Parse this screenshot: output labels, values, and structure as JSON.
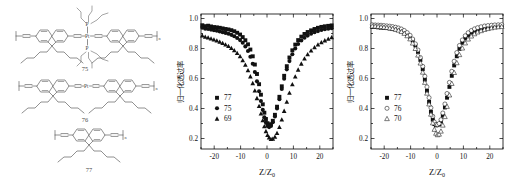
{
  "figure": {
    "background": "#ffffff",
    "panels": [
      "structures",
      "chart-left",
      "chart-right"
    ]
  },
  "structures": {
    "caption_75": "75",
    "caption_76": "76",
    "caption_77": "77",
    "atom_pt": "Pt",
    "atom_p_top": "P",
    "atom_p_bottom": "P",
    "repeat_n": "n",
    "items": [
      {
        "id": "75",
        "label": "75"
      },
      {
        "id": "76",
        "label": "76"
      },
      {
        "id": "77",
        "label": "77"
      }
    ]
  },
  "chart_data": [
    {
      "type": "scatter",
      "id": "chart-left",
      "title": "",
      "xlabel": "Z/Z0",
      "xlabel_main": "Z/Z",
      "xlabel_sub": "0",
      "ylabel": "归一化透过率",
      "xlim": [
        -25,
        25
      ],
      "ylim": [
        0.13,
        1.03
      ],
      "xticks": [
        -20,
        -10,
        0,
        10,
        20
      ],
      "xticklabels": [
        "-20",
        "-10",
        "0",
        "10",
        "20"
      ],
      "yticks": [
        0.2,
        0.4,
        0.6,
        0.8,
        1.0
      ],
      "yticklabels": [
        "0.2",
        "0.4",
        "0.6",
        "0.8",
        "1.0"
      ],
      "grid": false,
      "legend_position": "lower-left",
      "series": [
        {
          "name": "77",
          "marker": "filled-square",
          "x": [
            -24.5,
            -23.4,
            -22.3,
            -21.2,
            -20.1,
            -19.0,
            -17.9,
            -16.8,
            -15.7,
            -14.6,
            -13.5,
            -12.4,
            -11.3,
            -10.2,
            -9.2,
            -8.2,
            -7.2,
            -6.3,
            -5.4,
            -4.6,
            -3.8,
            -3.0,
            -2.3,
            -1.6,
            -1.0,
            -0.4,
            0.2,
            0.8,
            1.5,
            2.2,
            3.0,
            3.8,
            4.7,
            5.6,
            6.5,
            7.5,
            8.5,
            9.6,
            10.7,
            11.8,
            13.0,
            14.2,
            15.4,
            16.7,
            18.0,
            19.3,
            20.6,
            21.9,
            23.2,
            24.5
          ],
          "y": [
            0.955,
            0.949,
            0.952,
            0.947,
            0.943,
            0.941,
            0.938,
            0.934,
            0.93,
            0.927,
            0.922,
            0.915,
            0.905,
            0.893,
            0.876,
            0.855,
            0.828,
            0.793,
            0.748,
            0.693,
            0.63,
            0.562,
            0.492,
            0.428,
            0.372,
            0.33,
            0.302,
            0.29,
            0.295,
            0.318,
            0.358,
            0.412,
            0.478,
            0.548,
            0.618,
            0.682,
            0.74,
            0.788,
            0.826,
            0.856,
            0.879,
            0.897,
            0.91,
            0.921,
            0.93,
            0.938,
            0.944,
            0.948,
            0.951,
            0.954
          ]
        },
        {
          "name": "75",
          "marker": "filled-circle",
          "x": [
            -24.5,
            -23.4,
            -22.3,
            -21.2,
            -20.1,
            -19.0,
            -17.9,
            -16.8,
            -15.7,
            -14.6,
            -13.5,
            -12.4,
            -11.3,
            -10.2,
            -9.2,
            -8.2,
            -7.2,
            -6.3,
            -5.4,
            -4.6,
            -3.8,
            -3.0,
            -2.3,
            -1.6,
            -1.0,
            -0.4,
            0.2,
            0.8,
            1.5,
            2.2,
            3.0,
            3.8,
            4.7,
            5.6,
            6.5,
            7.5,
            8.5,
            9.6,
            10.7,
            11.8,
            13.0,
            14.2,
            15.4,
            16.7,
            18.0,
            19.3,
            20.6,
            21.9,
            23.2,
            24.5
          ],
          "y": [
            0.938,
            0.932,
            0.93,
            0.926,
            0.922,
            0.918,
            0.914,
            0.909,
            0.904,
            0.898,
            0.891,
            0.882,
            0.87,
            0.856,
            0.838,
            0.814,
            0.783,
            0.745,
            0.698,
            0.643,
            0.581,
            0.515,
            0.45,
            0.391,
            0.342,
            0.306,
            0.284,
            0.276,
            0.284,
            0.308,
            0.347,
            0.4,
            0.462,
            0.53,
            0.598,
            0.661,
            0.716,
            0.762,
            0.8,
            0.83,
            0.853,
            0.872,
            0.886,
            0.898,
            0.908,
            0.916,
            0.923,
            0.928,
            0.932,
            0.935
          ]
        },
        {
          "name": "69",
          "marker": "filled-triangle",
          "x": [
            -24.5,
            -23.4,
            -22.3,
            -21.2,
            -20.1,
            -19.0,
            -17.9,
            -16.8,
            -15.7,
            -14.6,
            -13.5,
            -12.4,
            -11.3,
            -10.2,
            -9.2,
            -8.2,
            -7.2,
            -6.3,
            -5.4,
            -4.6,
            -3.8,
            -3.0,
            -2.3,
            -1.6,
            -1.0,
            -0.4,
            0.2,
            0.8,
            1.5,
            2.2,
            3.0,
            3.8,
            4.7,
            5.6,
            6.5,
            7.5,
            8.5,
            9.6,
            10.7,
            11.8,
            13.0,
            14.2,
            15.4,
            16.7,
            18.0,
            19.3,
            20.6,
            21.9,
            23.2,
            24.5
          ],
          "y": [
            0.885,
            0.877,
            0.872,
            0.866,
            0.859,
            0.852,
            0.844,
            0.836,
            0.826,
            0.815,
            0.802,
            0.787,
            0.769,
            0.747,
            0.721,
            0.69,
            0.654,
            0.613,
            0.568,
            0.519,
            0.468,
            0.416,
            0.366,
            0.32,
            0.28,
            0.248,
            0.222,
            0.205,
            0.196,
            0.197,
            0.21,
            0.236,
            0.275,
            0.325,
            0.383,
            0.444,
            0.504,
            0.56,
            0.612,
            0.658,
            0.698,
            0.732,
            0.761,
            0.786,
            0.807,
            0.825,
            0.84,
            0.853,
            0.864,
            0.874
          ]
        }
      ]
    },
    {
      "type": "scatter",
      "id": "chart-right",
      "title": "",
      "xlabel": "Z/Z0",
      "xlabel_main": "Z/Z",
      "xlabel_sub": "0",
      "ylabel": "归一化透过率",
      "xlim": [
        -25,
        25
      ],
      "ylim": [
        0.13,
        1.03
      ],
      "xticks": [
        -20,
        -10,
        0,
        10,
        20
      ],
      "xticklabels": [
        "-20",
        "-10",
        "0",
        "10",
        "20"
      ],
      "yticks": [
        0.2,
        0.4,
        0.6,
        0.8,
        1.0
      ],
      "yticklabels": [
        "0.2",
        "0.4",
        "0.6",
        "0.8",
        "1.0"
      ],
      "grid": false,
      "legend_position": "lower-left",
      "series": [
        {
          "name": "77",
          "marker": "filled-square",
          "x": [
            -24.5,
            -23.4,
            -22.3,
            -21.2,
            -20.1,
            -19.0,
            -17.9,
            -16.8,
            -15.7,
            -14.6,
            -13.5,
            -12.4,
            -11.3,
            -10.2,
            -9.2,
            -8.2,
            -7.2,
            -6.3,
            -5.4,
            -4.6,
            -3.8,
            -3.0,
            -2.3,
            -1.6,
            -1.0,
            -0.4,
            0.2,
            0.8,
            1.5,
            2.2,
            3.0,
            3.8,
            4.7,
            5.6,
            6.5,
            7.5,
            8.5,
            9.6,
            10.7,
            11.8,
            13.0,
            14.2,
            15.4,
            16.7,
            18.0,
            19.3,
            20.6,
            21.9,
            23.2,
            24.5
          ],
          "y": [
            0.944,
            0.943,
            0.941,
            0.939,
            0.937,
            0.936,
            0.934,
            0.931,
            0.928,
            0.924,
            0.918,
            0.909,
            0.896,
            0.878,
            0.853,
            0.82,
            0.777,
            0.724,
            0.662,
            0.592,
            0.518,
            0.444,
            0.378,
            0.326,
            0.296,
            0.288,
            0.289,
            0.295,
            0.314,
            0.352,
            0.407,
            0.472,
            0.544,
            0.618,
            0.687,
            0.748,
            0.798,
            0.838,
            0.868,
            0.89,
            0.906,
            0.918,
            0.927,
            0.934,
            0.939,
            0.943,
            0.946,
            0.948,
            0.95,
            0.951
          ]
        },
        {
          "name": "76",
          "marker": "open-circle",
          "x": [
            -24.5,
            -23.4,
            -22.3,
            -21.2,
            -20.1,
            -19.0,
            -17.9,
            -16.8,
            -15.7,
            -14.6,
            -13.5,
            -12.4,
            -11.3,
            -10.2,
            -9.2,
            -8.2,
            -7.2,
            -6.3,
            -5.4,
            -4.6,
            -3.8,
            -3.0,
            -2.3,
            -1.6,
            -1.0,
            -0.4,
            0.2,
            0.8,
            1.5,
            2.2,
            3.0,
            3.8,
            4.7,
            5.6,
            6.5,
            7.5,
            8.5,
            9.6,
            10.7,
            11.8,
            13.0,
            14.2,
            15.4,
            16.7,
            18.0,
            19.3,
            20.6,
            21.9,
            23.2,
            24.5
          ],
          "y": [
            0.958,
            0.957,
            0.956,
            0.955,
            0.953,
            0.951,
            0.949,
            0.946,
            0.942,
            0.937,
            0.93,
            0.92,
            0.906,
            0.888,
            0.863,
            0.831,
            0.79,
            0.74,
            0.681,
            0.615,
            0.544,
            0.472,
            0.405,
            0.348,
            0.31,
            0.294,
            0.292,
            0.3,
            0.325,
            0.37,
            0.43,
            0.5,
            0.574,
            0.648,
            0.715,
            0.773,
            0.82,
            0.857,
            0.885,
            0.905,
            0.92,
            0.931,
            0.939,
            0.945,
            0.95,
            0.953,
            0.955,
            0.957,
            0.958,
            0.959
          ]
        },
        {
          "name": "70",
          "marker": "open-triangle",
          "x": [
            -24.5,
            -23.4,
            -22.3,
            -21.2,
            -20.1,
            -19.0,
            -17.9,
            -16.8,
            -15.7,
            -14.6,
            -13.5,
            -12.4,
            -11.3,
            -10.2,
            -9.2,
            -8.2,
            -7.2,
            -6.3,
            -5.4,
            -4.6,
            -3.8,
            -3.0,
            -2.3,
            -1.6,
            -1.0,
            -0.4,
            0.2,
            0.8,
            1.5,
            2.2,
            3.0,
            3.8,
            4.7,
            5.6,
            6.5,
            7.5,
            8.5,
            9.6,
            10.7,
            11.8,
            13.0,
            14.2,
            15.4,
            16.7,
            18.0,
            19.3,
            20.6,
            21.9,
            23.2,
            24.5
          ],
          "y": [
            0.949,
            0.948,
            0.946,
            0.944,
            0.941,
            0.939,
            0.936,
            0.932,
            0.927,
            0.921,
            0.912,
            0.9,
            0.884,
            0.863,
            0.835,
            0.799,
            0.755,
            0.702,
            0.641,
            0.573,
            0.501,
            0.429,
            0.361,
            0.303,
            0.26,
            0.234,
            0.224,
            0.228,
            0.248,
            0.288,
            0.345,
            0.413,
            0.489,
            0.566,
            0.639,
            0.704,
            0.758,
            0.802,
            0.836,
            0.862,
            0.882,
            0.897,
            0.909,
            0.918,
            0.926,
            0.932,
            0.937,
            0.941,
            0.944,
            0.946
          ]
        }
      ]
    }
  ]
}
